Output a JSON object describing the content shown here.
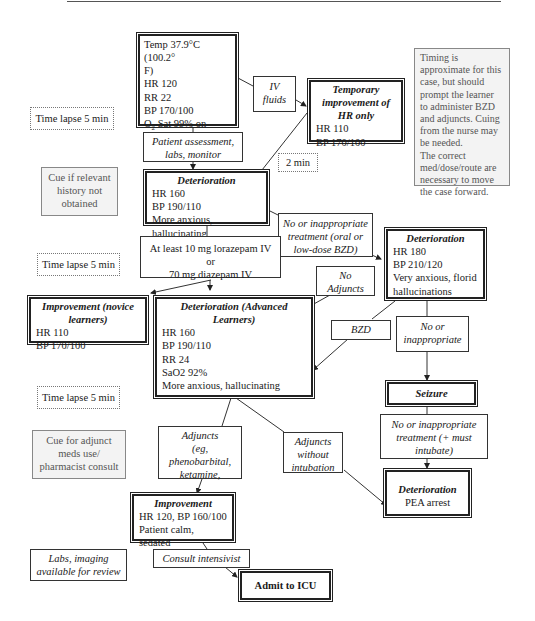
{
  "diagram": {
    "initial_state": {
      "lines": [
        "Temp 37.9°C (100.2°",
        "F)",
        "HR 120",
        "RR 22",
        "BP 170/100",
        "O2 Sat 99% on",
        "Anxious, oriented x2"
      ],
      "o2_prefix": "O",
      "o2_sub": "2",
      "o2_rest": " Sat 99% on"
    },
    "iv_fluids": {
      "line1": "IV",
      "line2": "fluids"
    },
    "temporary_improvement": {
      "title": "Temporary improvement of HR only",
      "lines": [
        "HR 110",
        "BP 170/100"
      ]
    },
    "timing_note": {
      "lines": [
        "Timing is",
        "approximate for this",
        "case, but should",
        "prompt the learner",
        "to administer BZD",
        "and adjuncts. Cuing",
        "from the nurse may",
        "be needed.",
        "The correct",
        "med/dose/route are",
        "necessary to move",
        "the case forward."
      ]
    },
    "time_lapse_1": "Time lapse 5 min",
    "patient_assessment": {
      "line1": "Patient assessment,",
      "line2": "labs, monitor"
    },
    "two_min": "2 min",
    "cue_history": {
      "line1": "Cue if relevant",
      "line2": "history not",
      "line3": "obtained"
    },
    "deterioration_1": {
      "title": "Deterioration",
      "lines": [
        "HR 160",
        "BP 190/110",
        "More anxious, hallucinating"
      ]
    },
    "no_inappropriate_1": {
      "line1": "No or inappropriate",
      "line2": "treatment (oral or",
      "line3": "low-dose BZD)"
    },
    "deterioration_2": {
      "title": "Deterioration",
      "lines": [
        "HR 180",
        "BP 210/120",
        "Very anxious, florid",
        "hallucinations"
      ]
    },
    "bzd_dose": {
      "line1": "At least 10 mg lorazepam IV or",
      "line2": "70 mg diazepam IV"
    },
    "time_lapse_2": "Time lapse 5 min",
    "no_adjuncts": {
      "line1": "No",
      "line2": "Adjuncts"
    },
    "improvement_novice": {
      "title": "Improvement (novice learners)",
      "lines": [
        "HR 110",
        "BP 170/100"
      ]
    },
    "deterioration_advanced": {
      "title": "Deterioration (Advanced Learners)",
      "lines": [
        "HR 160",
        "BP 190/110",
        "RR 24",
        "SaO2 92%",
        "More anxious, hallucinating"
      ]
    },
    "bzd_label": "BZD",
    "no_inappropriate_2": {
      "line1": "No or",
      "line2": "inappropriate"
    },
    "seizure": {
      "title": "Seizure"
    },
    "time_lapse_3": "Time lapse 5 min",
    "cue_adjunct": {
      "line1": "Cue for adjunct",
      "line2": "meds use/",
      "line3": "pharmacist consult"
    },
    "adjuncts": {
      "line1": "Adjuncts",
      "line2": "(eg,",
      "line3": "phenobarbital,",
      "line4": "ketamine,"
    },
    "adjuncts_no_intubation": {
      "line1": "Adjuncts",
      "line2": "without",
      "line3": "intubation"
    },
    "no_inappropriate_3": {
      "line1": "No or inappropriate",
      "line2": "treatment (+ must",
      "line3": "intubate)"
    },
    "deterioration_pea": {
      "title": "Deterioration",
      "line": "PEA arrest"
    },
    "improvement_final": {
      "title": "Improvement",
      "lines": [
        "HR 120, BP 160/100",
        "Patient calm, sedated"
      ]
    },
    "labs_imaging": {
      "line1": "Labs, imaging",
      "line2": "available for review"
    },
    "consult_intensivist": "Consult intensivist",
    "admit_icu": "Admit to ICU"
  }
}
